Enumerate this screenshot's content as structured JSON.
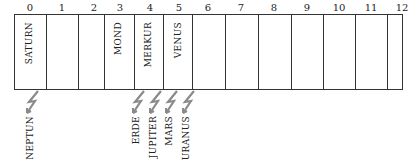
{
  "columns": [
    "0",
    "1",
    "2",
    "3",
    "4",
    "5",
    "6",
    "7",
    "8",
    "9",
    "10",
    "11",
    "12"
  ],
  "inside_labels": [
    {
      "col": 0,
      "text": "SATURN"
    },
    {
      "col": 3,
      "text": "MOND"
    },
    {
      "col": 4,
      "text": "MERKUR"
    },
    {
      "col": 5,
      "text": "VENUS"
    }
  ],
  "outside_labels": [
    {
      "text": "NEPTUN",
      "x": 30
    },
    {
      "text": "ERDE",
      "x": 136
    },
    {
      "text": "JUPITER",
      "x": 153
    },
    {
      "text": "MARS",
      "x": 169
    },
    {
      "text": "URANUS",
      "x": 186
    }
  ],
  "colors": {
    "bolt": "#8a8a8a",
    "line": "#333333"
  }
}
